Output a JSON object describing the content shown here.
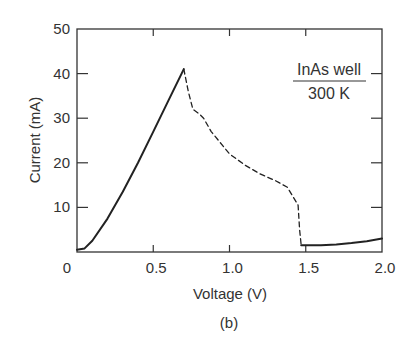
{
  "chart_data": {
    "type": "line",
    "title": "",
    "caption": "(b)",
    "xlabel": "Voltage (V)",
    "ylabel": "Current (mA)",
    "xlim": [
      0,
      2.0
    ],
    "ylim": [
      0,
      50
    ],
    "xticks": [
      0,
      0.5,
      1.0,
      1.5,
      2.0
    ],
    "xtick_labels": [
      "0",
      "0.5",
      "1.0",
      "1.5",
      "2.0"
    ],
    "yticks": [
      10,
      20,
      30,
      40,
      50
    ],
    "ytick_labels": [
      "10",
      "20",
      "30",
      "40",
      "50"
    ],
    "zero_label": "0",
    "grid": false,
    "annotation": {
      "line1": "InAs well",
      "line2": "300 K"
    },
    "series": [
      {
        "name": "rising branch",
        "style": "solid",
        "x": [
          0.0,
          0.05,
          0.1,
          0.2,
          0.3,
          0.4,
          0.5,
          0.6,
          0.7
        ],
        "y": [
          0.5,
          0.8,
          2.5,
          7.5,
          13.5,
          20.0,
          27.0,
          34.0,
          41.0
        ]
      },
      {
        "name": "negative differential resistance region",
        "style": "dashed",
        "x": [
          0.7,
          0.73,
          0.76,
          0.8,
          0.83,
          0.88,
          1.0,
          1.1,
          1.2,
          1.3,
          1.38,
          1.45,
          1.46,
          1.47
        ],
        "y": [
          41.0,
          36.0,
          32.0,
          31.0,
          30.0,
          27.0,
          22.0,
          19.5,
          17.5,
          16.0,
          14.5,
          10.5,
          5.0,
          1.5
        ]
      },
      {
        "name": "valley branch",
        "style": "solid",
        "x": [
          1.47,
          1.6,
          1.7,
          1.8,
          1.9,
          2.0
        ],
        "y": [
          1.5,
          1.5,
          1.7,
          2.0,
          2.4,
          3.0
        ]
      }
    ]
  }
}
